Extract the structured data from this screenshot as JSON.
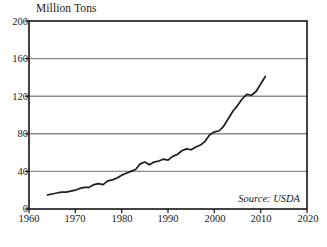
{
  "chart_data": {
    "type": "line",
    "title": "Million Tons",
    "xlabel": "",
    "ylabel": "Million Tons",
    "xlim": [
      1960,
      2020
    ],
    "ylim": [
      0,
      200
    ],
    "xticks": [
      1960,
      1970,
      1980,
      1990,
      2000,
      2010,
      2020
    ],
    "yticks": [
      0,
      40,
      80,
      120,
      160,
      200
    ],
    "grid": "horizontal",
    "legend": "none",
    "annotation": "Source: USDA",
    "line_color": "#1c1c1c",
    "grid_color": "#8c8c8c",
    "frame_color": "#141414",
    "series": [
      {
        "name": "Million Tons",
        "x": [
          1964,
          1965,
          1966,
          1967,
          1968,
          1969,
          1970,
          1971,
          1972,
          1973,
          1974,
          1975,
          1976,
          1977,
          1978,
          1979,
          1980,
          1981,
          1982,
          1983,
          1984,
          1985,
          1986,
          1987,
          1988,
          1989,
          1990,
          1991,
          1992,
          1993,
          1994,
          1995,
          1996,
          1997,
          1998,
          1999,
          2000,
          2001,
          2002,
          2003,
          2004,
          2005,
          2006,
          2007,
          2008,
          2009,
          2010,
          2011
        ],
        "values": [
          15,
          16,
          17,
          18,
          18,
          19,
          20,
          22,
          23,
          23,
          26,
          27,
          26,
          30,
          31,
          33,
          36,
          38,
          40,
          42,
          48,
          50,
          47,
          50,
          51,
          53,
          52,
          56,
          58,
          62,
          64,
          63,
          66,
          68,
          72,
          79,
          82,
          83,
          88,
          96,
          104,
          110,
          117,
          122,
          121,
          125,
          133,
          141
        ]
      }
    ]
  },
  "yticklabels": [
    "200",
    "160",
    "120",
    "80",
    "40",
    "0"
  ],
  "xticklabels": [
    "1960",
    "1970",
    "1980",
    "1990",
    "2000",
    "2010",
    "2020"
  ],
  "title_text": "Million Tons",
  "source_text": "Source: USDA"
}
